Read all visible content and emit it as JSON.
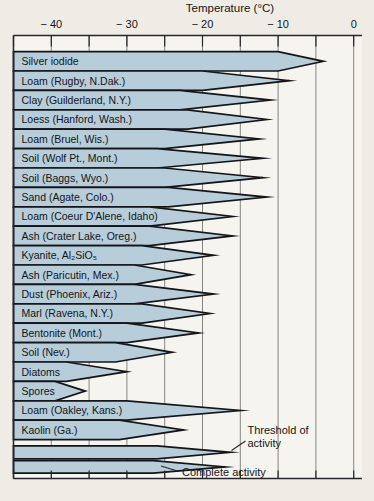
{
  "chart_data": {
    "type": "bar",
    "title": "Temperature (°C)",
    "xlabel": "Temperature (°C)",
    "description_semantics": "Horizontal wedge bars; sharp right tip = threshold of activity temperature, taper start = complete activity temperature",
    "axis": {
      "min": -45,
      "max": 0,
      "grid": true,
      "minor_tick_step": 5,
      "major_ticks": [
        {
          "value": -40,
          "label": "− 40"
        },
        {
          "value": -30,
          "label": "− 30"
        },
        {
          "value": -20,
          "label": "− 20"
        },
        {
          "value": -10,
          "label": "− 10"
        },
        {
          "value": 0,
          "label": "0"
        }
      ]
    },
    "materials": [
      {
        "label": "Silver iodide",
        "threshold_c": -4,
        "complete_c": -10
      },
      {
        "label": "Loam (Rugby, N.Dak.)",
        "threshold_c": -8.5,
        "complete_c": -20
      },
      {
        "label": "Clay (Guilderland, N.Y.)",
        "threshold_c": -11,
        "complete_c": -23
      },
      {
        "label": "Loess (Hanford, Wash.)",
        "threshold_c": -11.5,
        "complete_c": -22
      },
      {
        "label": "Loam (Bruel, Wis.)",
        "threshold_c": -12.5,
        "complete_c": -25
      },
      {
        "label": "Soil (Wolf Pt., Mont.)",
        "threshold_c": -12,
        "complete_c": -26
      },
      {
        "label": "Soil (Baggs, Wyo.)",
        "threshold_c": -12,
        "complete_c": -25
      },
      {
        "label": "Sand (Agate, Colo.)",
        "threshold_c": -11.5,
        "complete_c": -24.5
      },
      {
        "label": "Loam (Coeur D'Alene, Idaho)",
        "threshold_c": -16,
        "complete_c": -27
      },
      {
        "label": "Ash (Crater Lake, Oreg.)",
        "threshold_c": -16,
        "complete_c": -27
      },
      {
        "label": "Kyanite, Al₂SiO₅",
        "threshold_c": -18.5,
        "complete_c": -28
      },
      {
        "label": "Ash (Paricutin, Mex.)",
        "threshold_c": -21.5,
        "complete_c": -29
      },
      {
        "label": "Dust (Phoenix, Ariz.)",
        "threshold_c": -18.5,
        "complete_c": -29
      },
      {
        "label": "Marl (Ravena, N.Y.)",
        "threshold_c": -19,
        "complete_c": -28
      },
      {
        "label": "Bentonite (Mont.)",
        "threshold_c": -20.5,
        "complete_c": -30
      },
      {
        "label": "Soil (Nev.)",
        "threshold_c": -24,
        "complete_c": -31.5
      },
      {
        "label": "Diatoms",
        "threshold_c": -30,
        "complete_c": -38
      },
      {
        "label": "Spores",
        "threshold_c": -35.5,
        "complete_c": -39.5
      },
      {
        "label": "Loam (Oakley, Kans.)",
        "threshold_c": -15,
        "complete_c": -30
      },
      {
        "label": "Kaolin (Ga.)",
        "threshold_c": -22.5,
        "complete_c": -31
      }
    ],
    "legend_examples": [
      {
        "threshold_c": -16.3,
        "complete_c": -26
      },
      {
        "threshold_c": -17,
        "complete_c": -26.5
      }
    ],
    "annotations": {
      "threshold": {
        "line1": "Threshold of",
        "line2": "activity"
      },
      "complete": {
        "text": "Complete activity"
      }
    },
    "colors": {
      "bar_fill": "#b7cdda",
      "bar_stroke": "#15151a",
      "grid": "#85857f",
      "axis": "#26262b",
      "text": "#141418",
      "page_background": "#efece5",
      "plot_background": "#f6f4ee"
    }
  }
}
